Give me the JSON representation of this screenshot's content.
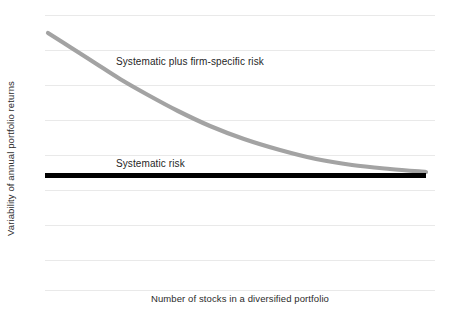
{
  "chart_data": {
    "type": "line",
    "title": "",
    "subtitle": "",
    "xlabel": "Number of stocks in a diversified portfolio",
    "ylabel": "Variability of annual portfolio returns",
    "xlim": [
      0,
      100
    ],
    "ylim": [
      0,
      100
    ],
    "grid": "horizontal",
    "legend_position": "inline-annotations",
    "x_tick_labels": [],
    "y_tick_labels": [],
    "gridlines_y_px": [
      15,
      50,
      85,
      120,
      155,
      190,
      225,
      260,
      290
    ],
    "annotations": [
      {
        "name": "total-risk",
        "text": "Systematic plus firm-specific risk",
        "x_px": 116,
        "y_px": 56
      },
      {
        "name": "systematic-risk",
        "text": "Systematic risk",
        "x_px": 116,
        "y_px": 158
      }
    ],
    "series": [
      {
        "name": "Systematic plus firm-specific risk",
        "color": "#a3a3a3",
        "stroke_width": 4.2,
        "style": "solid",
        "shape": "exponential-decay",
        "x": [
          0,
          5,
          10,
          15,
          20,
          25,
          30,
          35,
          40,
          45,
          50,
          60,
          70,
          80,
          90,
          100
        ],
        "values": [
          92,
          83,
          75,
          68,
          62,
          56,
          51,
          46,
          42,
          39,
          36,
          31,
          28,
          25,
          23,
          22
        ],
        "points_px": [
          [
            48,
            33
          ],
          [
            70,
            47
          ],
          [
            95,
            63
          ],
          [
            120,
            79
          ],
          [
            148,
            95
          ],
          [
            178,
            111
          ],
          [
            210,
            126
          ],
          [
            244,
            139
          ],
          [
            280,
            150
          ],
          [
            316,
            159
          ],
          [
            352,
            165
          ],
          [
            390,
            169
          ],
          [
            426,
            172
          ]
        ]
      },
      {
        "name": "Systematic risk",
        "color": "#000000",
        "stroke_width": 5,
        "style": "solid",
        "shape": "horizontal-constant",
        "x": [
          0,
          100
        ],
        "values": [
          21,
          21
        ],
        "points_px": [
          [
            45,
            175
          ],
          [
            426,
            175
          ]
        ]
      }
    ]
  },
  "colors": {
    "background": "#ffffff",
    "gridline": "#e9e9e9",
    "total_risk_curve": "#a3a3a3",
    "systematic_risk_line": "#000000",
    "text": "#2b2b2b"
  }
}
